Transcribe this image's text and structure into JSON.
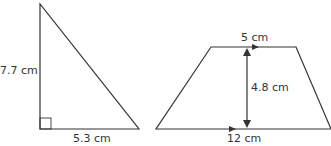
{
  "triangle": {
    "height_label": "7.7 cm",
    "base_label": "5.3 cm",
    "right_angle_marker": true
  },
  "trapezoid": {
    "top_label": "5 cm",
    "bottom_label": "12 cm",
    "height_label": "4.8 cm",
    "parallel_arrows": true
  },
  "colors": {
    "stroke": "#333333",
    "background": "#ffffff"
  }
}
